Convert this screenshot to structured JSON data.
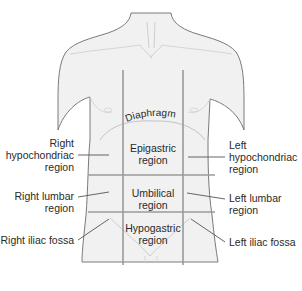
{
  "diagram": {
    "colors": {
      "skin_fill": "#f1f1f1",
      "outline": "#7a7a7a",
      "grid_lines": "#9a9a9a",
      "leader_lines": "#555555",
      "text": "#2a2a2a"
    },
    "structures": {
      "diaphragm": "Diaphragm"
    },
    "regions": {
      "epigastric": {
        "line1": "Epigastric",
        "line2": "region"
      },
      "umbilical": {
        "line1": "Umbilical",
        "line2": "region"
      },
      "hypogastric": {
        "line1": "Hypogastric",
        "line2": "region"
      }
    },
    "left_labels": {
      "right_hypochondriac": {
        "line1": "Right",
        "line2": "hypochondriac",
        "line3": "region"
      },
      "right_lumbar": {
        "line1": "Right lumbar",
        "line2": "region"
      },
      "right_iliac": {
        "line1": "Right iliac fossa"
      }
    },
    "right_labels": {
      "left_hypochondriac": {
        "line1": "Left",
        "line2": "hypochondriac",
        "line3": "region"
      },
      "left_lumbar": {
        "line1": "Left lumbar",
        "line2": "region"
      },
      "left_iliac": {
        "line1": "Left iliac fossa"
      }
    }
  }
}
